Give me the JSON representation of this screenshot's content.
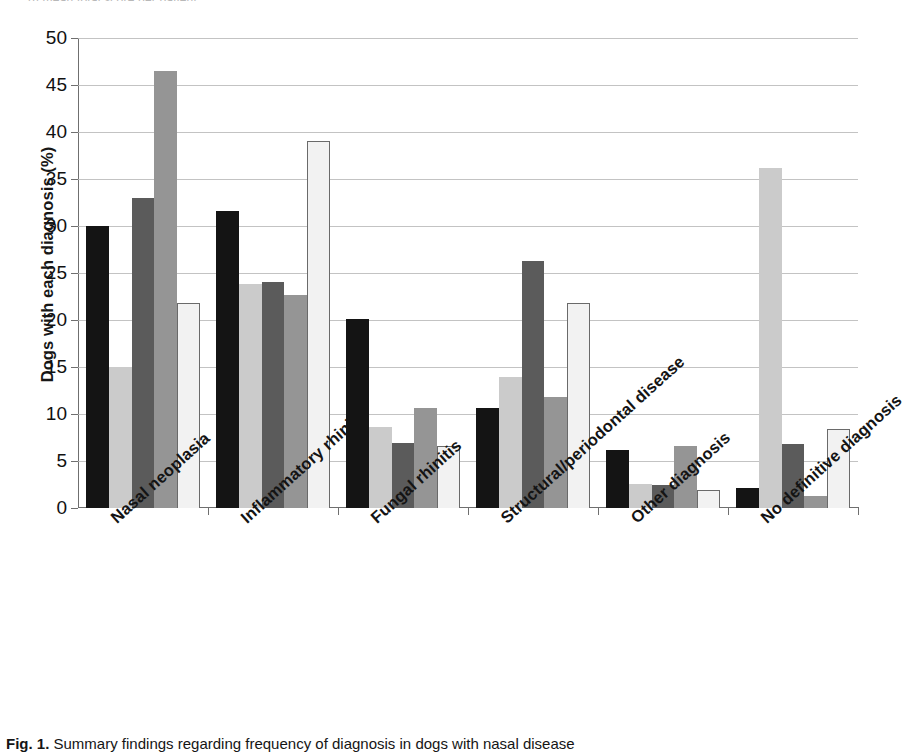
{
  "figure": {
    "top_clipped_text": "b) mean total score per patient",
    "caption_label": "Fig. 1.",
    "caption_text": "Summary findings regarding frequency of diagnosis in dogs with nasal disease"
  },
  "chart_data": {
    "type": "bar",
    "title": "",
    "xlabel": "",
    "ylabel": "Dogs with each diagnosis (%)",
    "ylim": [
      0,
      50
    ],
    "ytick_step": 5,
    "yticks": [
      "50",
      "45",
      "40",
      "35",
      "30",
      "25",
      "20",
      "15",
      "10",
      "5",
      "0"
    ],
    "grid": "horizontal",
    "legend_position": "none",
    "categories": [
      "Nasal neoplasia",
      "Inflammatory rhinitis",
      "Fungal rhinitis",
      "Structural/periodontal disease",
      "Other diagnosis",
      "No definitive diagnosis"
    ],
    "series": [
      {
        "name": "Series 1",
        "color": "#141414",
        "border": "#141414",
        "values": [
          30.0,
          31.6,
          20.1,
          10.6,
          6.2,
          2.1
        ]
      },
      {
        "name": "Series 2",
        "color": "#cbcbcb",
        "border": "#cbcbcb",
        "values": [
          15.0,
          23.8,
          8.6,
          13.9,
          2.6,
          36.2
        ]
      },
      {
        "name": "Series 3",
        "color": "#5b5b5b",
        "border": "#5b5b5b",
        "values": [
          33.0,
          24.0,
          6.9,
          26.3,
          2.4,
          6.8
        ]
      },
      {
        "name": "Series 4",
        "color": "#959595",
        "border": "#959595",
        "values": [
          46.5,
          22.7,
          10.6,
          11.8,
          6.6,
          1.3
        ]
      },
      {
        "name": "Series 5",
        "color": "#f2f2f2",
        "border": "#6a6a6a",
        "values": [
          21.8,
          39.0,
          6.6,
          21.8,
          1.9,
          8.4
        ]
      }
    ]
  }
}
